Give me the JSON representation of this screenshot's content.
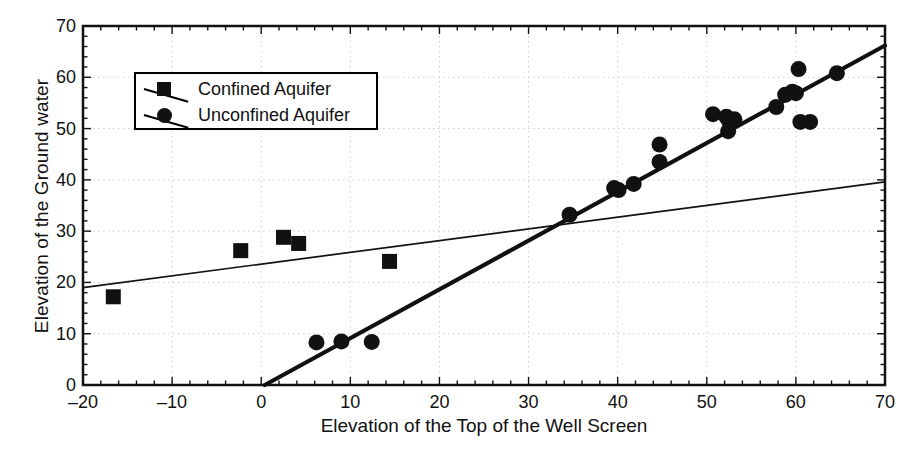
{
  "chart_data": {
    "type": "scatter",
    "title": "",
    "xlabel": "Elevation of the Top of the Well Screen",
    "ylabel": "Elevation of the Ground water",
    "xlim": [
      -20,
      70
    ],
    "ylim": [
      0,
      70
    ],
    "xticks": [
      -20,
      -10,
      0,
      10,
      20,
      30,
      40,
      50,
      60,
      70
    ],
    "yticks": [
      0,
      10,
      20,
      30,
      40,
      50,
      60,
      70
    ],
    "xtick_labels": [
      "–20",
      "–10",
      "0",
      "10",
      "20",
      "30",
      "40",
      "50",
      "60",
      "70"
    ],
    "ytick_labels": [
      "0",
      "10",
      "20",
      "30",
      "40",
      "50",
      "60",
      "70"
    ],
    "grid": true,
    "legend_position": "upper left",
    "series": [
      {
        "name": "Confined Aquifer",
        "marker": "square",
        "color": "#111111",
        "points": [
          {
            "x": -16.6,
            "y": 17.2
          },
          {
            "x": -2.3,
            "y": 26.2
          },
          {
            "x": 2.5,
            "y": 28.8
          },
          {
            "x": 4.2,
            "y": 27.6
          },
          {
            "x": 14.4,
            "y": 24.1
          }
        ],
        "trendline": {
          "x0": -20,
          "y0": 19.0,
          "x1": 70,
          "y1": 39.6,
          "width": "thin"
        }
      },
      {
        "name": "Unconfined Aquifer",
        "marker": "circle",
        "color": "#111111",
        "points": [
          {
            "x": 6.2,
            "y": 8.3
          },
          {
            "x": 9.0,
            "y": 8.5
          },
          {
            "x": 12.4,
            "y": 8.4
          },
          {
            "x": 34.6,
            "y": 33.2
          },
          {
            "x": 39.6,
            "y": 38.4
          },
          {
            "x": 40.1,
            "y": 38.0
          },
          {
            "x": 41.8,
            "y": 39.2
          },
          {
            "x": 44.7,
            "y": 46.9
          },
          {
            "x": 44.7,
            "y": 43.5
          },
          {
            "x": 50.7,
            "y": 52.8
          },
          {
            "x": 52.2,
            "y": 52.3
          },
          {
            "x": 52.5,
            "y": 51.5
          },
          {
            "x": 52.4,
            "y": 49.5
          },
          {
            "x": 53.1,
            "y": 51.8
          },
          {
            "x": 57.8,
            "y": 54.2
          },
          {
            "x": 58.8,
            "y": 56.6
          },
          {
            "x": 59.6,
            "y": 57.2
          },
          {
            "x": 60.0,
            "y": 56.9
          },
          {
            "x": 60.3,
            "y": 61.6
          },
          {
            "x": 60.5,
            "y": 51.3
          },
          {
            "x": 61.6,
            "y": 51.3
          },
          {
            "x": 64.6,
            "y": 60.8
          }
        ],
        "trendline": {
          "x0": 0.4,
          "y0": 0.0,
          "x1": 70.0,
          "y1": 66.2,
          "width": "thick"
        }
      }
    ]
  },
  "legend": {
    "items": [
      {
        "label": "Confined Aquifer",
        "marker": "square"
      },
      {
        "label": "Unconfined Aquifer",
        "marker": "circle"
      }
    ]
  }
}
